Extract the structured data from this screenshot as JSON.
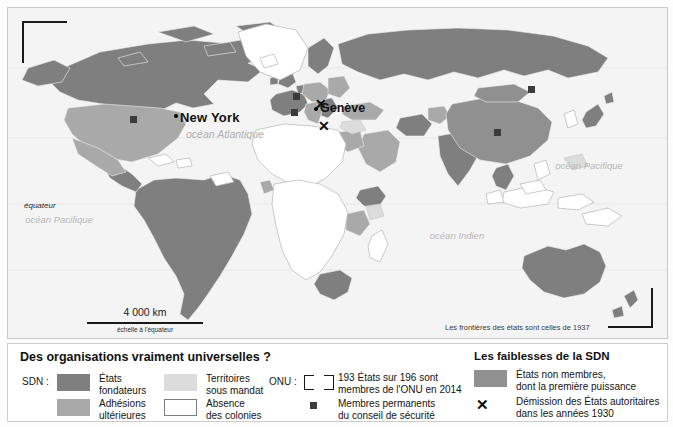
{
  "map": {
    "labels": {
      "equateur": "équateur",
      "ocean_atlantique": "océan\nAtlantique",
      "ocean_pacifique_west": "océan\nPacifique",
      "ocean_pacifique_east": "océan\nPacifique",
      "ocean_indien": "océan Indien",
      "new_york": "New York",
      "geneve": "Genève",
      "frontieres_note": "Les frontières des états sont celles de 1937"
    },
    "scale": {
      "distance": "4 000 km",
      "caption": "échelle à l'équateur"
    },
    "markers": {
      "x_symbol": "✕"
    }
  },
  "legend": {
    "title": "Des organisations vraiment universelles ?",
    "weakness_title": "Les faiblesses de la SDN",
    "groups": {
      "sdn": "SDN :",
      "onu": "ONU :"
    },
    "items": [
      {
        "swatch": "founders",
        "label": "États\nfondateurs"
      },
      {
        "swatch": "mandate",
        "label": "Territoires\nsous mandat"
      },
      {
        "swatch": "later",
        "label": "Adhésions\nultérieures"
      },
      {
        "swatch": "no-colonies",
        "label": "Absence\ndes colonies"
      },
      {
        "swatch": "onu-bracket",
        "label": "193 États sur 196 sont\nmembres de l'ONU en 2014"
      },
      {
        "swatch": "square",
        "label": "Membres permanents\ndu conseil de sécurité"
      },
      {
        "swatch": "non-member",
        "label": "États non membres,\ndont la première puissance"
      },
      {
        "swatch": "x-mark",
        "label": "Démission des États autoritaires\ndans les années 1930"
      }
    ]
  },
  "colors": {
    "founders": "#7f7f7f",
    "later_members": "#a9a9a9",
    "mandate": "#dcdcdc",
    "no_colonies": "#ffffff",
    "non_member": "#909090",
    "ocean": "#f4f4f4",
    "marker": "#3b3b3b",
    "ink": "#1a1a1a"
  }
}
